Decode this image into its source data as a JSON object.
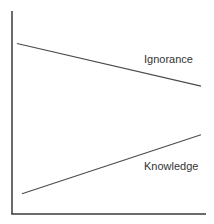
{
  "chart_data": {
    "type": "line",
    "title": "",
    "xlabel": "",
    "ylabel": "",
    "grid": false,
    "legend": "inline labels",
    "x": [
      0,
      1
    ],
    "xlim": [
      0,
      1
    ],
    "ylim": [
      0,
      1
    ],
    "series": [
      {
        "name": "Ignorance",
        "values": [
          0.84,
          0.63
        ],
        "color": "#4a4a4a"
      },
      {
        "name": "Knowledge",
        "values": [
          0.1,
          0.39
        ],
        "color": "#4a4a4a"
      }
    ]
  },
  "labels": {
    "ignorance": "Ignorance",
    "knowledge": "Knowledge"
  },
  "colors": {
    "axis": "#3a3a3a",
    "line": "#4a4a4a",
    "text": "#333333",
    "background": "#ffffff"
  }
}
